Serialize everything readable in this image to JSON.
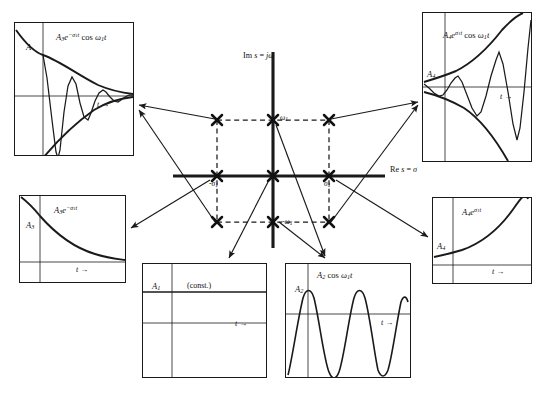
{
  "figure": {
    "kind": "s-plane pole location vs time response map",
    "splane": {
      "imaginary_axis_label": "Im s = jω",
      "real_axis_label": "Re s = σ",
      "pole_marker": "x-cross",
      "pole_labels": {
        "omega_positive": "ω",
        "omega_positive_sub": "1",
        "omega_negative": "-ω",
        "omega_negative_sub": "1",
        "sigma_negative": "-σ",
        "sigma_negative_sub": "1",
        "sigma_positive": "σ",
        "sigma_positive_sub": "1"
      },
      "poles": [
        {
          "name": "pole-upper-left",
          "x": -1,
          "y": 1,
          "marker": "x"
        },
        {
          "name": "pole-upper-center",
          "x": 0,
          "y": 1,
          "marker": "x"
        },
        {
          "name": "pole-upper-right",
          "x": 1,
          "y": 1,
          "marker": "x"
        },
        {
          "name": "pole-origin-left",
          "x": -1,
          "y": 0,
          "marker": "x"
        },
        {
          "name": "pole-origin",
          "x": 0,
          "y": 0,
          "marker": "x"
        },
        {
          "name": "pole-origin-right",
          "x": 1,
          "y": 0,
          "marker": "x"
        },
        {
          "name": "pole-lower-left",
          "x": -1,
          "y": -1,
          "marker": "x"
        },
        {
          "name": "pole-lower-center",
          "x": 0,
          "y": -1,
          "marker": "x"
        },
        {
          "name": "pole-lower-right",
          "x": 1,
          "y": -1,
          "marker": "x"
        }
      ]
    },
    "panels": [
      {
        "id": "top-left",
        "name": "damped-oscillation-plot",
        "equation_amplitude": "A",
        "equation_amplitude_sub": "3",
        "equation_base": "e",
        "equation_exponent": "-σ",
        "equation_exponent_sub": "1",
        "equation_exponent_t": "t",
        "equation_tail": "cos ω",
        "equation_tail_sub": "1",
        "equation_tail_t": "t",
        "amplitude_label": "A",
        "amplitude_label_sub": "",
        "time_axis": "t →",
        "description": "decaying exponential envelope times cosine"
      },
      {
        "id": "top-right",
        "name": "growing-oscillation-plot",
        "equation_amplitude": "A",
        "equation_amplitude_sub": "4",
        "equation_base": "e",
        "equation_exponent": "σ",
        "equation_exponent_sub": "1",
        "equation_exponent_t": "t",
        "equation_tail": "cos ω",
        "equation_tail_sub": "1",
        "equation_tail_t": "t",
        "amplitude_label": "A",
        "amplitude_label_sub": "4",
        "time_axis": "t →",
        "description": "growing exponential envelope times cosine"
      },
      {
        "id": "mid-left",
        "name": "decaying-exponential-plot",
        "equation_amplitude": "A",
        "equation_amplitude_sub": "3",
        "equation_base": "e",
        "equation_exponent": "-σ",
        "equation_exponent_sub": "1",
        "equation_exponent_t": "t",
        "amplitude_label": "A",
        "amplitude_label_sub": "3",
        "time_axis": "t →",
        "description": "pure decaying exponential"
      },
      {
        "id": "mid-right",
        "name": "growing-exponential-plot",
        "equation_amplitude": "A",
        "equation_amplitude_sub": "4",
        "equation_base": "e",
        "equation_exponent": "σ",
        "equation_exponent_sub": "1",
        "equation_exponent_t": "t",
        "amplitude_label": "A",
        "amplitude_label_sub": "4",
        "time_axis": "t →",
        "description": "pure growing exponential"
      },
      {
        "id": "bottom-left",
        "name": "constant-plot",
        "amplitude_label": "A",
        "amplitude_label_sub": "1",
        "const_label": "(const.)",
        "time_axis": "t →",
        "description": "constant step value"
      },
      {
        "id": "bottom-right",
        "name": "cosine-plot",
        "equation_amplitude": "A",
        "equation_amplitude_sub": "2",
        "equation_tail": "cos ω",
        "equation_tail_sub": "1",
        "equation_tail_t": "t",
        "amplitude_label": "A",
        "amplitude_label_sub": "2",
        "time_axis": "t →",
        "description": "undamped sustained cosine"
      }
    ],
    "colors": {
      "ink": "#1a1a1a",
      "background": "#ffffff",
      "axis": "#111111"
    }
  }
}
